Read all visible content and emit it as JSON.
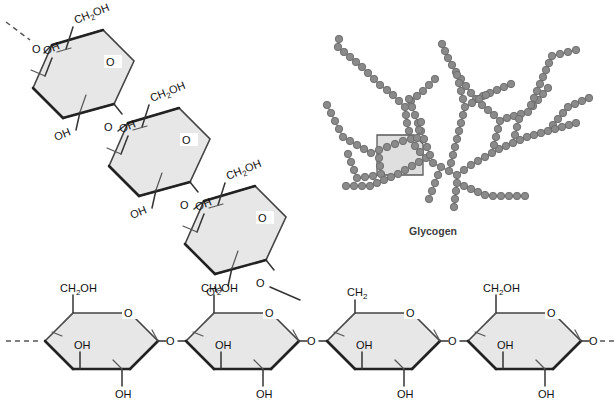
{
  "figure": {
    "caption": "Glycogen",
    "colors": {
      "ring_fill": "#e7e7e7",
      "ring_stroke": "#444444",
      "bond": "#333333",
      "node_fill": "#8a8a8a",
      "node_stroke": "#6a6a6a",
      "highlight_fill": "#d9d9d9",
      "highlight_stroke": "#5a5a5a",
      "caption_color": "#3d3d3d",
      "background": "#ffffff"
    }
  },
  "labels": {
    "ch2oh": "CH",
    "ch2oh_sub": "2",
    "ch2oh_tail": "OH",
    "ch2": "CH",
    "ch2_sub": "2",
    "oh": "OH",
    "o": "O"
  },
  "main_chain": {
    "name": "alpha-1,4-linked glucose backbone",
    "residue_count": 4,
    "residues": [
      {
        "id": "g1",
        "c6_label": "CH2OH",
        "c2_label": "OH",
        "c3_label": "OH",
        "ring_o": "O",
        "branch_point": false
      },
      {
        "id": "g2",
        "c6_label": "CH2OH",
        "c2_label": "OH",
        "c3_label": "OH",
        "ring_o": "O",
        "branch_point": false
      },
      {
        "id": "g3",
        "c6_label": "CH2",
        "c2_label": "OH",
        "c3_label": "OH",
        "ring_o": "O",
        "branch_point": true
      },
      {
        "id": "g4",
        "c6_label": "CH2OH",
        "c2_label": "OH",
        "c3_label": "OH",
        "ring_o": "O",
        "branch_point": false
      }
    ],
    "linker_label": "O",
    "left_terminus": "dashed-continuation",
    "right_terminus": "dashed-continuation"
  },
  "branch_chain": {
    "name": "alpha-1,6-linked branch",
    "residue_count": 3,
    "residues": [
      {
        "id": "b1",
        "c6_label": "CH2OH",
        "c2_label": "OH",
        "c3_label": "OH",
        "ring_o": "O"
      },
      {
        "id": "b2",
        "c6_label": "CH2OH",
        "c2_label": "OH",
        "c3_label": "OH",
        "ring_o": "O"
      },
      {
        "id": "b3",
        "c6_label": "CH2OH",
        "c2_label": "OH",
        "c3_label": "OH",
        "ring_o": "O"
      }
    ],
    "linker_label": "O",
    "top_terminus": "dashed-continuation"
  },
  "glycogen_tree": {
    "caption": "Glycogen",
    "node_count": 196,
    "highlight_region": {
      "shape": "clipped-square",
      "x": 377,
      "y": 135,
      "w": 46,
      "h": 40
    },
    "chains": [
      {
        "points": [
          [
            457,
            175
          ],
          [
            457,
            183
          ],
          [
            456,
            191
          ],
          [
            455,
            199
          ],
          [
            454,
            207
          ]
        ]
      },
      {
        "points": [
          [
            457,
            175
          ],
          [
            449,
            171
          ],
          [
            441,
            167
          ],
          [
            433,
            163
          ],
          [
            426,
            158
          ],
          [
            420,
            152
          ],
          [
            415,
            146
          ],
          [
            411,
            139
          ]
        ]
      },
      {
        "points": [
          [
            411,
            139
          ],
          [
            409,
            131
          ],
          [
            407,
            123
          ],
          [
            406,
            115
          ],
          [
            405,
            107
          ]
        ]
      },
      {
        "points": [
          [
            411,
            139
          ],
          [
            403,
            141
          ],
          [
            395,
            144
          ],
          [
            387,
            147
          ],
          [
            379,
            150
          ],
          [
            371,
            153
          ]
        ]
      },
      {
        "points": [
          [
            379,
            150
          ],
          [
            379,
            158
          ],
          [
            380,
            166
          ],
          [
            381,
            174
          ]
        ]
      },
      {
        "points": [
          [
            381,
            174
          ],
          [
            373,
            176
          ],
          [
            365,
            177
          ],
          [
            357,
            178
          ]
        ]
      },
      {
        "points": [
          [
            405,
            107
          ],
          [
            399,
            101
          ],
          [
            393,
            95
          ],
          [
            387,
            90
          ],
          [
            380,
            85
          ]
        ]
      },
      {
        "points": [
          [
            405,
            107
          ],
          [
            411,
            101
          ],
          [
            417,
            96
          ],
          [
            423,
            91
          ],
          [
            429,
            85
          ],
          [
            435,
            79
          ]
        ]
      },
      {
        "points": [
          [
            380,
            85
          ],
          [
            374,
            79
          ],
          [
            368,
            73
          ],
          [
            362,
            67
          ],
          [
            356,
            62
          ]
        ]
      },
      {
        "points": [
          [
            356,
            62
          ],
          [
            350,
            57
          ],
          [
            344,
            52
          ],
          [
            338,
            47
          ],
          [
            339,
            39
          ]
        ]
      },
      {
        "points": [
          [
            371,
            153
          ],
          [
            364,
            149
          ],
          [
            357,
            145
          ],
          [
            350,
            141
          ],
          [
            343,
            137
          ]
        ]
      },
      {
        "points": [
          [
            457,
            175
          ],
          [
            464,
            170
          ],
          [
            471,
            165
          ],
          [
            478,
            161
          ],
          [
            485,
            157
          ],
          [
            492,
            153
          ]
        ]
      },
      {
        "points": [
          [
            492,
            153
          ],
          [
            499,
            149
          ],
          [
            506,
            146
          ],
          [
            513,
            143
          ],
          [
            520,
            140
          ]
        ]
      },
      {
        "points": [
          [
            492,
            153
          ],
          [
            494,
            145
          ],
          [
            496,
            137
          ],
          [
            498,
            129
          ],
          [
            500,
            121
          ]
        ]
      },
      {
        "points": [
          [
            500,
            121
          ],
          [
            494,
            115
          ],
          [
            488,
            110
          ],
          [
            482,
            105
          ],
          [
            476,
            99
          ]
        ]
      },
      {
        "points": [
          [
            476,
            99
          ],
          [
            471,
            93
          ],
          [
            466,
            86
          ],
          [
            461,
            79
          ],
          [
            456,
            72
          ]
        ]
      },
      {
        "points": [
          [
            456,
            72
          ],
          [
            452,
            65
          ],
          [
            448,
            58
          ],
          [
            445,
            51
          ],
          [
            442,
            44
          ]
        ]
      },
      {
        "points": [
          [
            476,
            99
          ],
          [
            483,
            96
          ],
          [
            490,
            93
          ],
          [
            497,
            90
          ],
          [
            504,
            87
          ],
          [
            511,
            84
          ]
        ]
      },
      {
        "points": [
          [
            500,
            121
          ],
          [
            507,
            118
          ],
          [
            514,
            116
          ],
          [
            521,
            114
          ],
          [
            528,
            112
          ]
        ]
      },
      {
        "points": [
          [
            528,
            112
          ],
          [
            533,
            106
          ],
          [
            538,
            100
          ],
          [
            543,
            94
          ],
          [
            548,
            88
          ]
        ]
      },
      {
        "points": [
          [
            528,
            112
          ],
          [
            531,
            105
          ],
          [
            534,
            98
          ],
          [
            537,
            91
          ],
          [
            540,
            84
          ]
        ]
      },
      {
        "points": [
          [
            540,
            84
          ],
          [
            543,
            77
          ],
          [
            546,
            70
          ],
          [
            549,
            63
          ],
          [
            552,
            56
          ]
        ]
      },
      {
        "points": [
          [
            520,
            140
          ],
          [
            527,
            137
          ],
          [
            534,
            135
          ],
          [
            541,
            133
          ],
          [
            548,
            131
          ]
        ]
      },
      {
        "points": [
          [
            548,
            131
          ],
          [
            553,
            125
          ],
          [
            558,
            119
          ],
          [
            563,
            113
          ],
          [
            568,
            107
          ]
        ]
      },
      {
        "points": [
          [
            548,
            131
          ],
          [
            555,
            129
          ],
          [
            562,
            127
          ],
          [
            569,
            125
          ],
          [
            576,
            123
          ]
        ]
      },
      {
        "points": [
          [
            457,
            183
          ],
          [
            464,
            186
          ],
          [
            471,
            189
          ],
          [
            478,
            192
          ],
          [
            485,
            195
          ]
        ]
      },
      {
        "points": [
          [
            485,
            195
          ],
          [
            493,
            196
          ],
          [
            501,
            196
          ],
          [
            509,
            196
          ],
          [
            517,
            196
          ],
          [
            525,
            196
          ]
        ]
      },
      {
        "points": [
          [
            441,
            167
          ],
          [
            438,
            175
          ],
          [
            435,
            183
          ],
          [
            432,
            191
          ],
          [
            429,
            199
          ]
        ]
      },
      {
        "points": [
          [
            426,
            158
          ],
          [
            419,
            162
          ],
          [
            412,
            166
          ],
          [
            405,
            170
          ],
          [
            398,
            174
          ]
        ]
      },
      {
        "points": [
          [
            398,
            174
          ],
          [
            391,
            177
          ],
          [
            384,
            180
          ],
          [
            377,
            183
          ],
          [
            370,
            186
          ]
        ]
      },
      {
        "points": [
          [
            370,
            186
          ],
          [
            362,
            186
          ],
          [
            354,
            186
          ],
          [
            346,
            186
          ]
        ]
      },
      {
        "points": [
          [
            433,
            163
          ],
          [
            430,
            155
          ],
          [
            427,
            147
          ],
          [
            424,
            139
          ],
          [
            421,
            131
          ]
        ]
      },
      {
        "points": [
          [
            421,
            131
          ],
          [
            418,
            123
          ],
          [
            415,
            115
          ],
          [
            412,
            107
          ],
          [
            409,
            99
          ]
        ]
      },
      {
        "points": [
          [
            449,
            171
          ],
          [
            451,
            163
          ],
          [
            453,
            155
          ],
          [
            455,
            147
          ],
          [
            457,
            139
          ]
        ]
      },
      {
        "points": [
          [
            457,
            139
          ],
          [
            459,
            131
          ],
          [
            461,
            123
          ],
          [
            463,
            115
          ],
          [
            465,
            107
          ]
        ]
      },
      {
        "points": [
          [
            465,
            107
          ],
          [
            463,
            99
          ],
          [
            461,
            91
          ],
          [
            459,
            83
          ],
          [
            457,
            75
          ]
        ]
      },
      {
        "points": [
          [
            415,
            146
          ],
          [
            417,
            138
          ],
          [
            419,
            130
          ],
          [
            421,
            122
          ]
        ]
      },
      {
        "points": [
          [
            343,
            137
          ],
          [
            339,
            129
          ],
          [
            335,
            121
          ],
          [
            331,
            113
          ],
          [
            327,
            105
          ]
        ]
      },
      {
        "points": [
          [
            357,
            178
          ],
          [
            354,
            170
          ],
          [
            351,
            162
          ],
          [
            348,
            154
          ]
        ]
      },
      {
        "points": [
          [
            465,
            107
          ],
          [
            472,
            103
          ],
          [
            479,
            99
          ],
          [
            486,
            95
          ]
        ]
      },
      {
        "points": [
          [
            513,
            143
          ],
          [
            515,
            135
          ],
          [
            517,
            127
          ],
          [
            519,
            119
          ]
        ]
      },
      {
        "points": [
          [
            552,
            56
          ],
          [
            560,
            54
          ],
          [
            568,
            52
          ],
          [
            576,
            50
          ]
        ]
      },
      {
        "points": [
          [
            568,
            107
          ],
          [
            575,
            104
          ],
          [
            582,
            101
          ],
          [
            589,
            98
          ]
        ]
      }
    ]
  }
}
